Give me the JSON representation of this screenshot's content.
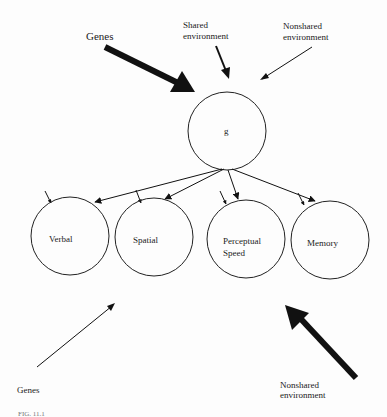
{
  "diagram": {
    "top_sources": {
      "genes": "Genes",
      "shared_line1": "Shared",
      "shared_line2": "environment",
      "nonshared_line1": "Nonshared",
      "nonshared_line2": "environment"
    },
    "general_factor": {
      "label": "g"
    },
    "abilities": [
      {
        "label_line1": "Verbal",
        "label_line2": ""
      },
      {
        "label_line1": "Spatial",
        "label_line2": ""
      },
      {
        "label_line1": "Perceptual",
        "label_line2": "Speed"
      },
      {
        "label_line1": "Memory",
        "label_line2": ""
      }
    ],
    "bottom_sources": {
      "genes": "Genes",
      "nonshared_line1": "Nonshared",
      "nonshared_line2": "environment"
    },
    "caption_fragment": "FIG. 11.1",
    "colors": {
      "line": "#111111",
      "background": "#fdfdfd"
    }
  }
}
